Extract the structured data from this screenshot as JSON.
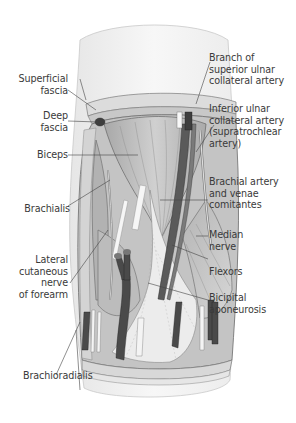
{
  "figure": {
    "colors": {
      "skin": "#f4f4f4",
      "fascia": "#d8d8d8",
      "muscle": "#bdbdbd",
      "muscle_dark": "#9a9a9a",
      "vessel": "#555555",
      "tendon": "#efefef",
      "label_text": "#3a3a3a",
      "leader_line": "#444444"
    }
  },
  "labels": {
    "left": [
      {
        "id": "superficial-fascia",
        "lines": [
          "Superficial",
          "fascia"
        ]
      },
      {
        "id": "deep-fascia",
        "lines": [
          "Deep",
          "fascia"
        ]
      },
      {
        "id": "biceps",
        "lines": [
          "Biceps"
        ]
      },
      {
        "id": "brachialis",
        "lines": [
          "Brachialis"
        ]
      },
      {
        "id": "lateral-cutaneous-nerve",
        "lines": [
          "Lateral",
          "cutaneous",
          "nerve",
          "of forearm"
        ]
      },
      {
        "id": "brachioradialis",
        "lines": [
          "Brachioradialis"
        ]
      }
    ],
    "right": [
      {
        "id": "branch-superior-ulnar",
        "lines": [
          "Branch of",
          "superior ulnar",
          "collateral artery"
        ]
      },
      {
        "id": "inferior-ulnar",
        "lines": [
          "Inferior ulnar",
          "collateral artery",
          "(supratrochlear",
          "artery)"
        ]
      },
      {
        "id": "brachial-artery",
        "lines": [
          "Brachial artery",
          "and venae",
          "comitantes"
        ]
      },
      {
        "id": "median-nerve",
        "lines": [
          "Median",
          "nerve"
        ]
      },
      {
        "id": "flexors",
        "lines": [
          "Flexors"
        ]
      },
      {
        "id": "bicipital-aponeurosis",
        "lines": [
          "Bicipital",
          "aponeurosis"
        ]
      }
    ]
  }
}
